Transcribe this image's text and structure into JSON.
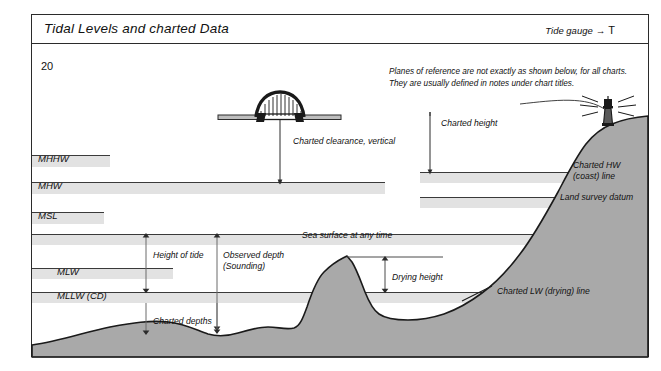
{
  "header": {
    "title": "Tidal Levels and charted Data",
    "tide_gauge_label": "Tide gauge",
    "tide_gauge_arrow": "→",
    "tide_gauge_symbol": "T"
  },
  "corner_number": "20",
  "note": "Planes of reference are not exactly as shown below, for all charts. They are usually defined in notes under chart titles.",
  "levels": [
    {
      "id": "mhhw",
      "label": "MHHW"
    },
    {
      "id": "mhw",
      "label": "MHW"
    },
    {
      "id": "msl",
      "label": "MSL"
    },
    {
      "id": "mlw",
      "label": "MLW"
    },
    {
      "id": "mllw",
      "label": "MLLW   (CD)"
    }
  ],
  "annotations": {
    "charted_clearance": "Charted clearance, vertical",
    "charted_height": "Charted height",
    "charted_hw_line": "Charted HW\n(coast) line",
    "charted_hw_line_l1": "Charted HW",
    "charted_hw_line_l2": "(coast) line",
    "land_survey_datum": "Land survey datum",
    "sea_surface": "Sea surface at any time",
    "height_of_tide": "Height of tide",
    "observed_depth_l1": "Observed depth",
    "observed_depth_l2": "(Sounding)",
    "drying_height": "Drying height",
    "charted_depths": "Charted depths",
    "charted_lw_line": "Charted LW (drying) line"
  },
  "icons": {
    "bridge": "arch-bridge-icon",
    "beacon": "lighthouse-beacon-icon"
  },
  "colors": {
    "band_fill": "#e2e2e2",
    "band_line": "#3a3a3a",
    "land_fill": "#a9a9a9",
    "land_stroke": "#1a1a1a",
    "frame": "#2b2b2b",
    "text": "#111111"
  }
}
